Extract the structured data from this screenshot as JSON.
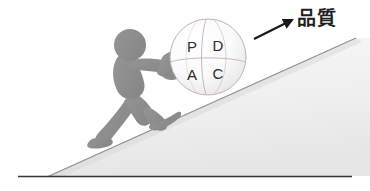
{
  "scene": {
    "title": "PDCA cycle ball pushed up a slope toward quality",
    "background_color": "#ffffff",
    "width": 370,
    "height": 191
  },
  "annotation": {
    "label_text": "品質",
    "label_color": "#1f1f1f",
    "arrow_color": "#1a1a1a",
    "arrow_from": "255,38",
    "arrow_to": "293,19"
  },
  "ball": {
    "name": "pdca-ball",
    "center_x": 208,
    "center_y": 57,
    "radius": 38,
    "fill_light": "#ffffff",
    "fill_shade": "#e3e3e3",
    "outline_color": "#b9b2b6",
    "meridian_color": "#bfa9b4",
    "letters": [
      {
        "id": "p",
        "text": "P",
        "x": 192,
        "y": 47
      },
      {
        "id": "d",
        "text": "D",
        "x": 217,
        "y": 46
      },
      {
        "id": "a",
        "text": "A",
        "x": 192,
        "y": 75
      },
      {
        "id": "c",
        "text": "C",
        "x": 217,
        "y": 74
      }
    ]
  },
  "figure": {
    "name": "person-pushing",
    "body_color": "#8e8e8e",
    "head_center_x": 130,
    "head_center_y": 45,
    "head_radius": 16
  },
  "slope": {
    "name": "incline-ramp",
    "fill_top": "#f7f7f7",
    "fill_bottom": "#ececec",
    "edge_color": "#9a9a9a",
    "apex_x": 48,
    "apex_y": 176,
    "top_x": 356,
    "top_y": 38
  },
  "ground": {
    "name": "ground-line",
    "color": "#2f2f3a",
    "y": 176,
    "x_start": 18,
    "x_end": 352
  }
}
